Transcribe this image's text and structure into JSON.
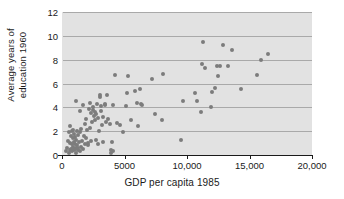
{
  "chart_data": {
    "type": "scatter",
    "title": "",
    "xlabel": "GDP per capita 1985",
    "ylabel_lines": [
      "Average years of",
      "education 1960"
    ],
    "ylabel": "Average years of education 1960",
    "xlim": [
      0,
      20000
    ],
    "ylim": [
      0,
      12
    ],
    "xticks": [
      0,
      5000,
      10000,
      15000,
      20000
    ],
    "xticklabels": [
      "0",
      "5000",
      "10,000",
      "15,000",
      "20,000"
    ],
    "yticks": [
      0,
      2,
      4,
      6,
      8,
      10,
      12
    ],
    "yticklabels": [
      "0",
      "2",
      "4",
      "6",
      "8",
      "10",
      "12"
    ],
    "gridlines": {
      "axis": "y",
      "values": [
        2,
        4,
        6,
        8,
        10,
        12
      ],
      "on": true
    },
    "legend": {
      "present": false,
      "position": "none"
    },
    "marker": {
      "shape": "circle",
      "color": "#7c7c7c",
      "size": 4
    },
    "panel_background": "#e2e2e2",
    "points": [
      [
        350,
        0.3
      ],
      [
        420,
        0.6
      ],
      [
        480,
        1.2
      ],
      [
        520,
        0.2
      ],
      [
        560,
        1.9
      ],
      [
        600,
        0.4
      ],
      [
        620,
        2.4
      ],
      [
        660,
        1.0
      ],
      [
        700,
        0.5
      ],
      [
        720,
        1.6
      ],
      [
        760,
        0.9
      ],
      [
        790,
        2.0
      ],
      [
        820,
        0.3
      ],
      [
        850,
        1.4
      ],
      [
        880,
        0.7
      ],
      [
        900,
        2.1
      ],
      [
        930,
        0.4
      ],
      [
        960,
        1.1
      ],
      [
        980,
        1.8
      ],
      [
        1000,
        0.5
      ],
      [
        1020,
        0.9
      ],
      [
        1050,
        1.5
      ],
      [
        1080,
        0.6
      ],
      [
        1100,
        4.5
      ],
      [
        1120,
        0.2
      ],
      [
        1150,
        1.3
      ],
      [
        1180,
        0.8
      ],
      [
        1200,
        2.0
      ],
      [
        1250,
        0.4
      ],
      [
        1280,
        1.7
      ],
      [
        1300,
        0.6
      ],
      [
        1350,
        1.1
      ],
      [
        1400,
        3.7
      ],
      [
        1420,
        0.3
      ],
      [
        1450,
        1.9
      ],
      [
        1500,
        0.7
      ],
      [
        1550,
        2.2
      ],
      [
        1600,
        1.2
      ],
      [
        1650,
        4.2
      ],
      [
        1700,
        0.5
      ],
      [
        1750,
        1.6
      ],
      [
        1800,
        2.6
      ],
      [
        1850,
        0.9
      ],
      [
        1900,
        1.4
      ],
      [
        1950,
        3.0
      ],
      [
        2000,
        2.1
      ],
      [
        2050,
        0.8
      ],
      [
        2100,
        1.0
      ],
      [
        2150,
        3.9
      ],
      [
        2200,
        2.3
      ],
      [
        2250,
        4.4
      ],
      [
        2300,
        3.5
      ],
      [
        2350,
        1.2
      ],
      [
        2400,
        2.8
      ],
      [
        2450,
        3.8
      ],
      [
        2500,
        4.0
      ],
      [
        2550,
        3.3
      ],
      [
        2600,
        3.6
      ],
      [
        2650,
        2.9
      ],
      [
        2700,
        1.3
      ],
      [
        2750,
        3.4
      ],
      [
        2800,
        4.3
      ],
      [
        2850,
        0.9
      ],
      [
        2900,
        3.1
      ],
      [
        2950,
        2.0
      ],
      [
        3000,
        4.9
      ],
      [
        3050,
        5.0
      ],
      [
        3100,
        4.1
      ],
      [
        3150,
        3.7
      ],
      [
        3200,
        2.5
      ],
      [
        3250,
        1.1
      ],
      [
        3300,
        3.2
      ],
      [
        3400,
        4.2
      ],
      [
        3450,
        4.3
      ],
      [
        3500,
        2.8
      ],
      [
        3600,
        5.0
      ],
      [
        3700,
        3.0
      ],
      [
        3800,
        2.6
      ],
      [
        3900,
        0.4
      ],
      [
        3950,
        0.2
      ],
      [
        4000,
        1.1
      ],
      [
        4050,
        0.3
      ],
      [
        4100,
        4.2
      ],
      [
        4200,
        6.7
      ],
      [
        4400,
        2.7
      ],
      [
        4600,
        2.5
      ],
      [
        4900,
        1.9
      ],
      [
        5100,
        4.1
      ],
      [
        5200,
        5.2
      ],
      [
        5300,
        6.6
      ],
      [
        5500,
        2.9
      ],
      [
        5800,
        5.4
      ],
      [
        6000,
        4.4
      ],
      [
        6100,
        2.4
      ],
      [
        6200,
        5.5
      ],
      [
        6300,
        4.3
      ],
      [
        6400,
        4.2
      ],
      [
        7200,
        6.4
      ],
      [
        7400,
        3.4
      ],
      [
        8000,
        2.9
      ],
      [
        8100,
        6.8
      ],
      [
        9500,
        1.3
      ],
      [
        9700,
        4.5
      ],
      [
        10600,
        5.2
      ],
      [
        10800,
        4.5
      ],
      [
        11100,
        3.6
      ],
      [
        11200,
        7.6
      ],
      [
        11300,
        9.5
      ],
      [
        11400,
        7.3
      ],
      [
        11900,
        4.0
      ],
      [
        12000,
        5.3
      ],
      [
        12200,
        5.6
      ],
      [
        12400,
        7.5
      ],
      [
        12500,
        6.6
      ],
      [
        12600,
        7.5
      ],
      [
        12900,
        9.2
      ],
      [
        13300,
        7.5
      ],
      [
        13600,
        8.8
      ],
      [
        14300,
        5.5
      ],
      [
        15600,
        6.7
      ],
      [
        15900,
        8.0
      ],
      [
        16500,
        8.5
      ]
    ]
  }
}
